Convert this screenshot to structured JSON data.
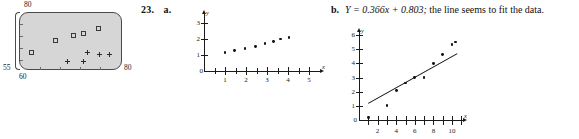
{
  "problem": {
    "number_label": "23.",
    "part_a_label": "a.",
    "part_b_label": "b.",
    "part_b_text_equation": "Y = 0.366x + 0.803;",
    "part_b_text_rest": " the line seems to fit the data.",
    "part_b_text_full": "Y = 0.366x + 0.803; the line seems to fit the data."
  },
  "calculator_plot": {
    "name": "graphing-calculator-scatter-window",
    "window": {
      "ymax": "80",
      "ymin": "55",
      "xmin": "60",
      "xmax": "80"
    },
    "screen_color": "#d6d6d6",
    "border_color": "#4a4a4a",
    "series": [
      {
        "name": "squares",
        "marker": "square",
        "points": [
          [
            0.11,
            0.31
          ],
          [
            0.34,
            0.52
          ],
          [
            0.52,
            0.6
          ],
          [
            0.62,
            0.64
          ],
          [
            0.76,
            0.74
          ]
        ]
      },
      {
        "name": "pluses",
        "marker": "plus",
        "points": [
          [
            0.46,
            0.16
          ],
          [
            0.62,
            0.16
          ],
          [
            0.66,
            0.33
          ],
          [
            0.78,
            0.3
          ],
          [
            0.88,
            0.3
          ]
        ]
      }
    ]
  },
  "chart_data": [
    {
      "type": "scatter",
      "name": "plot-23a",
      "title": "",
      "xlabel": "x",
      "ylabel": "y",
      "xlim": [
        0,
        5.6
      ],
      "ylim": [
        0,
        3.2
      ],
      "xticks": [
        1,
        2,
        3,
        4,
        5
      ],
      "xtick_labels": [
        "1",
        "2",
        "3",
        "4",
        "5"
      ],
      "yticks": [
        1,
        2,
        3
      ],
      "ytick_labels": [
        "1",
        "2",
        "3"
      ],
      "origin_label": "0",
      "grid": false,
      "legend": "none",
      "x": [
        1.0,
        1.45,
        1.95,
        2.45,
        2.9,
        3.3,
        3.65,
        4.05
      ],
      "y": [
        1.15,
        1.3,
        1.4,
        1.55,
        1.7,
        1.85,
        2.0,
        2.1
      ]
    },
    {
      "type": "scatter",
      "name": "plot-23b",
      "title": "",
      "xlabel": "x",
      "ylabel": "y",
      "xlim": [
        0,
        11.4
      ],
      "ylim": [
        0,
        6.3
      ],
      "xticks": [
        1,
        2,
        3,
        4,
        5,
        6,
        7,
        8,
        9,
        10,
        11
      ],
      "xtick_labels": [
        "",
        "2",
        "",
        "4",
        "",
        "6",
        "",
        "8",
        "",
        "10",
        ""
      ],
      "yticks": [
        1,
        2,
        3,
        4,
        5,
        6
      ],
      "ytick_labels": [
        "1",
        "2",
        "3",
        "4",
        "5",
        "6"
      ],
      "origin_label": "0",
      "grid": false,
      "legend": "none",
      "x": [
        1.0,
        3.0,
        4.0,
        5.0,
        6.0,
        7.0,
        8.0,
        9.0,
        10.0,
        10.4
      ],
      "y": [
        0.2,
        1.0,
        2.1,
        2.6,
        3.0,
        3.0,
        4.0,
        4.6,
        5.3,
        5.5
      ],
      "fit_line": {
        "equation": "Y = 0.366x + 0.803",
        "slope": 0.366,
        "intercept": 0.803,
        "from_x": 1.0,
        "to_x": 10.6
      }
    }
  ]
}
